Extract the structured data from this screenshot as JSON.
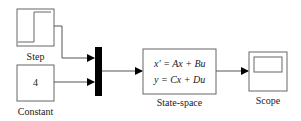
{
  "diagram": {
    "type": "simulink-block-diagram",
    "blocks": [
      {
        "id": "step",
        "label": "Step",
        "icon": "step-function-icon"
      },
      {
        "id": "constant",
        "label": "Constant",
        "value": "4"
      },
      {
        "id": "mux",
        "label": "",
        "icon": "mux-bar"
      },
      {
        "id": "state_space",
        "label": "State-space",
        "equations": [
          "x′ = Ax + Bu",
          "y = Cx + Du"
        ]
      },
      {
        "id": "scope",
        "label": "Scope",
        "icon": "scope-screen-icon"
      }
    ],
    "connections": [
      {
        "from": "step",
        "to": "mux",
        "port": 1
      },
      {
        "from": "constant",
        "to": "mux",
        "port": 2
      },
      {
        "from": "mux",
        "to": "state_space"
      },
      {
        "from": "state_space",
        "to": "scope"
      }
    ],
    "colors": {
      "stroke": "#555555",
      "fill": "#ffffff",
      "mux": "#000000",
      "text": "#222222"
    }
  }
}
